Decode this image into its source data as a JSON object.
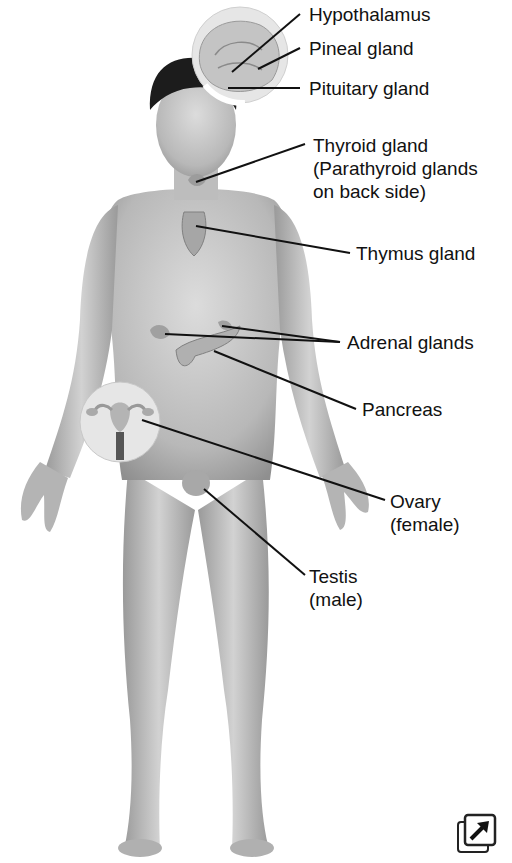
{
  "diagram": {
    "labels": [
      {
        "id": "hypothalamus",
        "lines": [
          "Hypothalamus"
        ],
        "x": 309,
        "y": 3
      },
      {
        "id": "pineal",
        "lines": [
          "Pineal gland"
        ],
        "x": 309,
        "y": 37
      },
      {
        "id": "pituitary",
        "lines": [
          "Pituitary gland"
        ],
        "x": 309,
        "y": 77
      },
      {
        "id": "thyroid",
        "lines": [
          "Thyroid gland",
          "(Parathyroid glands",
          "on back side)"
        ],
        "x": 313,
        "y": 136
      },
      {
        "id": "thymus",
        "lines": [
          "Thymus gland"
        ],
        "x": 356,
        "y": 242
      },
      {
        "id": "adrenal",
        "lines": [
          "Adrenal glands"
        ],
        "x": 347,
        "y": 331
      },
      {
        "id": "pancreas",
        "lines": [
          "Pancreas"
        ],
        "x": 362,
        "y": 398
      },
      {
        "id": "ovary",
        "lines": [
          "Ovary",
          "(female)"
        ],
        "x": 390,
        "y": 490
      },
      {
        "id": "testis",
        "lines": [
          "Testis",
          "(male)"
        ],
        "x": 309,
        "y": 565
      }
    ],
    "colors": {
      "skin": "#c9c9c9",
      "skin_dark": "#8a8a8a",
      "hair": "#1a1a1a",
      "line": "#111111",
      "inset": "#ececec"
    },
    "expand_icon": "expand-icon"
  }
}
